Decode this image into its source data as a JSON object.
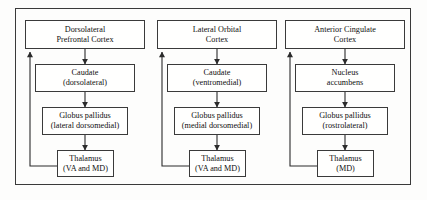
{
  "figure": {
    "frame": {
      "visible": true,
      "border_color": "#3a3a3a"
    },
    "background_color": "#fdfdfc",
    "text_color": "#101010"
  },
  "circuits": [
    {
      "id": "dorsolateral-prefrontal",
      "cortex": {
        "line1": "Dorsolateral",
        "line2": "Prefrontal Cortex"
      },
      "striatum": {
        "line1": "Caudate",
        "line2": "(dorsolateral)"
      },
      "pallidum": {
        "line1": "Globus pallidus",
        "line2": "(lateral dorsomedial)"
      },
      "thalamus": {
        "line1": "Thalamus",
        "line2": "(VA and MD)"
      }
    },
    {
      "id": "lateral-orbital",
      "cortex": {
        "line1": "Lateral Orbital",
        "line2": "Cortex"
      },
      "striatum": {
        "line1": "Caudate",
        "line2": "(ventromedial)"
      },
      "pallidum": {
        "line1": "Globus pallidus",
        "line2": "(medial dorsomedial)"
      },
      "thalamus": {
        "line1": "Thalamus",
        "line2": "(VA and MD)"
      }
    },
    {
      "id": "anterior-cingulate",
      "cortex": {
        "line1": "Anterior Cingulate",
        "line2": "Cortex"
      },
      "striatum": {
        "line1": "Nucleus",
        "line2": "accumbens"
      },
      "pallidum": {
        "line1": "Globus pallidus",
        "line2": "(rostrolateral)"
      },
      "thalamus": {
        "line1": "Thalamus",
        "line2": "(MD)"
      }
    }
  ],
  "connections": {
    "forward_arrow_icon": "arrow-down-icon",
    "feedback_arrow_icon": "arrow-up-icon",
    "description": "cortex to striatum to globus pallidus to thalamus, thalamus feeds back to cortex"
  }
}
